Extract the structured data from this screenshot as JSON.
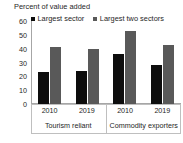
{
  "chart_data": {
    "type": "bar",
    "title": "Percent of value added",
    "subtitle": "",
    "xlabel": "",
    "ylabel": "",
    "ylim": [
      0,
      60
    ],
    "yticks": [
      0,
      10,
      20,
      30,
      40,
      50,
      60
    ],
    "grid": false,
    "legend_position": "top",
    "categories": [
      "2010",
      "2019",
      "2010",
      "2019"
    ],
    "groups": [
      {
        "label": "Tourism reliant",
        "categories": [
          "2010",
          "2019"
        ]
      },
      {
        "label": "Commodity exporters",
        "categories": [
          "2010",
          "2019"
        ]
      }
    ],
    "series": [
      {
        "name": "Largest sector",
        "color": "#0d0d0d",
        "values": [
          23,
          24,
          36,
          28
        ]
      },
      {
        "name": "Largest two sectors",
        "color": "#595959",
        "values": [
          41,
          40,
          53,
          43
        ]
      }
    ]
  },
  "axis": {
    "tick_0": "0",
    "tick_10": "10",
    "tick_20": "20",
    "tick_30": "30",
    "tick_40": "40",
    "tick_50": "50",
    "tick_60": "60"
  },
  "colors": {
    "series_1": "#0d0d0d",
    "series_2": "#595959",
    "axis": "#a6a6a6",
    "text": "#262626",
    "background": "#ffffff"
  }
}
